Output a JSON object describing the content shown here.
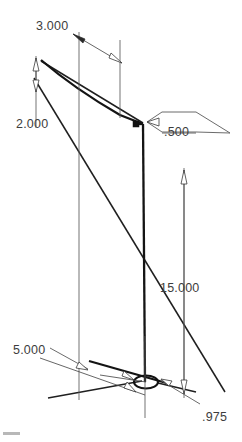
{
  "drawing": {
    "title": "Isometric dimensioned sketch",
    "view": "isometric",
    "background_color": "#ffffff",
    "line_color": "#1a1a1a",
    "text_color": "#3d3d3d",
    "dimensions": [
      {
        "id": "dim-3000",
        "label": "3.000",
        "name": "width-top-dimension",
        "text_x": 36,
        "text_y": 30,
        "orientation": "isometric-top-right"
      },
      {
        "id": "dim-2000",
        "label": "2.000",
        "name": "height-left-dimension",
        "text_x": 16,
        "text_y": 128,
        "orientation": "isometric-vertical-left"
      },
      {
        "id": "dim-500",
        "label": ".500",
        "name": "thickness-leader-dimension",
        "text_x": 164,
        "text_y": 136,
        "orientation": "leader"
      },
      {
        "id": "dim-15000",
        "label": "15.000",
        "name": "length-right-dimension",
        "text_x": 160,
        "text_y": 292,
        "orientation": "vertical-right"
      },
      {
        "id": "dim-5000",
        "label": "5.000",
        "name": "depth-bottom-left-dimension",
        "text_x": 13,
        "text_y": 354,
        "orientation": "leader"
      },
      {
        "id": "dim-975",
        "label": ".975",
        "name": "hole-diameter-dimension",
        "text_x": 202,
        "text_y": 421,
        "orientation": "leader"
      }
    ],
    "features": [
      {
        "id": "hole-1",
        "name": "circular-hole",
        "shape": "ellipse",
        "cx": 146,
        "cy": 382,
        "rx": 12,
        "ry": 6.5
      },
      {
        "id": "vertex-1",
        "name": "corner-vertex-marker",
        "shape": "square",
        "x": 135,
        "y": 124
      }
    ]
  }
}
